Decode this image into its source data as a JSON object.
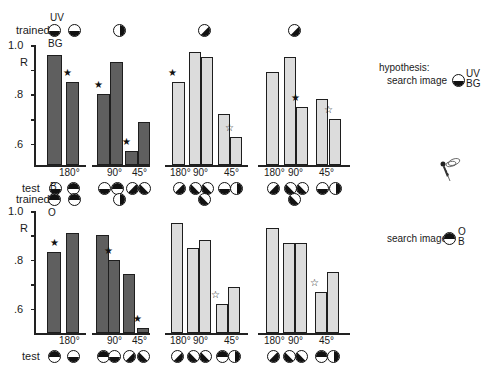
{
  "labels": {
    "trained": "trained",
    "test": "test",
    "R": "R",
    "top_trained_upper": "UV",
    "top_trained_lower": "BG",
    "bottom_trained_upper": "B",
    "bottom_trained_lower": "O",
    "hypothesis": "hypothesis:",
    "search_image": "search image",
    "top_si_upper": "UV",
    "top_si_lower": "BG",
    "bottom_si_upper": "O",
    "bottom_si_lower": "B",
    "y_1_0": "1.0",
    "y_0_8": ".8",
    "y_0_6": ".6",
    "deg180": "180°",
    "deg90": "90°",
    "deg45": "45°"
  },
  "chart_data": [
    {
      "type": "bar",
      "title": "Trained on UV/BG horizontal pattern",
      "ylabel": "R",
      "ylim": [
        0.5,
        1.0
      ],
      "yticks": [
        0.6,
        0.7,
        0.8,
        0.9,
        1.0
      ],
      "ytick_labels": [
        ".6",
        "",
        ".8",
        "",
        "1.0"
      ],
      "grid": false,
      "groups": [
        {
          "trained": "horizontal half disc (dark lower)",
          "categories": [
            "180°",
            "180°"
          ],
          "values": [
            0.96,
            0.85
          ],
          "stars": [
            "",
            "filled"
          ],
          "color": "dark"
        },
        {
          "trained": "vertical half disc",
          "categories": [
            "90°",
            "90°",
            "45°",
            "45°"
          ],
          "values": [
            0.8,
            0.93,
            0.57,
            0.69
          ],
          "stars": [
            "filled",
            "",
            "filled",
            ""
          ],
          "color": "dark"
        },
        {
          "trained": "diagonal half disc",
          "categories": [
            "180°",
            "90°",
            "90°",
            "45°",
            "45°"
          ],
          "values": [
            0.85,
            0.97,
            0.95,
            0.72,
            0.63
          ],
          "stars": [
            "filled",
            "",
            "",
            "",
            "open"
          ],
          "color": "light"
        },
        {
          "trained": "diagonal half disc",
          "categories": [
            "180°",
            "90°",
            "90°",
            "45°",
            "45°"
          ],
          "values": [
            0.89,
            0.95,
            0.75,
            0.78,
            0.7
          ],
          "stars": [
            "",
            "",
            "filled",
            "",
            "open"
          ],
          "color": "light"
        }
      ],
      "annotation": "hypothesis: search image UV/BG"
    },
    {
      "type": "bar",
      "title": "Trained on B/O horizontal pattern",
      "ylabel": "R",
      "ylim": [
        0.5,
        1.0
      ],
      "yticks": [
        0.6,
        0.7,
        0.8,
        0.9,
        1.0
      ],
      "ytick_labels": [
        ".6",
        "",
        ".8",
        "",
        "1.0"
      ],
      "grid": false,
      "groups": [
        {
          "trained": "horizontal half disc (dark upper)",
          "categories": [
            "180°",
            "180°"
          ],
          "values": [
            0.83,
            0.91
          ],
          "stars": [
            "filled",
            ""
          ],
          "color": "dark"
        },
        {
          "trained": "vertical half disc",
          "categories": [
            "90°",
            "90°",
            "45°",
            "45°"
          ],
          "values": [
            0.9,
            0.8,
            0.74,
            0.52
          ],
          "stars": [
            "",
            "filled",
            "",
            "filled"
          ],
          "color": "dark"
        },
        {
          "trained": "diagonal half disc",
          "categories": [
            "180°",
            "90°",
            "90°",
            "45°",
            "45°"
          ],
          "values": [
            0.95,
            0.85,
            0.88,
            0.62,
            0.69
          ],
          "stars": [
            "",
            "",
            "",
            "open",
            ""
          ],
          "color": "light"
        },
        {
          "trained": "diagonal half disc",
          "categories": [
            "180°",
            "90°",
            "90°",
            "45°",
            "45°"
          ],
          "values": [
            0.93,
            0.87,
            0.87,
            0.67,
            0.75
          ],
          "stars": [
            "",
            "",
            "",
            "open",
            ""
          ],
          "color": "light"
        }
      ],
      "annotation": "search image O/B"
    }
  ]
}
